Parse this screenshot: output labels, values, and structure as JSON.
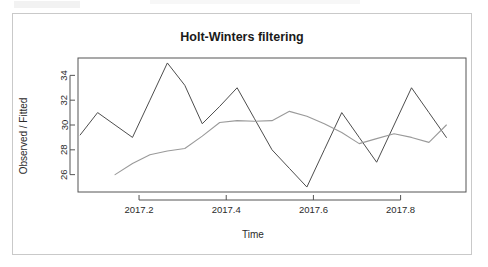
{
  "figure": {
    "title": "Holt-Winters filtering",
    "x_axis_label": "Time",
    "y_axis_label": "Observed / Fitted"
  },
  "chart_data": {
    "type": "line",
    "title": "Holt-Winters filtering",
    "xlabel": "Time",
    "ylabel": "Observed / Fitted",
    "grid": false,
    "legend": "none",
    "xlim": [
      2017.06,
      2017.95
    ],
    "ylim": [
      24.6,
      35.4
    ],
    "xticks": [
      2017.2,
      2017.4,
      2017.6,
      2017.8
    ],
    "xtick_labels": [
      "2017.2",
      "2017.4",
      "2017.6",
      "2017.8"
    ],
    "yticks": [
      26,
      28,
      30,
      32,
      34
    ],
    "ytick_labels": [
      "26",
      "28",
      "30",
      "32",
      "34"
    ],
    "series": [
      {
        "name": "Observed",
        "color": "#4d4d4d",
        "x": [
          2017.065,
          2017.105,
          2017.145,
          2017.185,
          2017.225,
          2017.265,
          2017.305,
          2017.345,
          2017.385,
          2017.425,
          2017.465,
          2017.505,
          2017.545,
          2017.585,
          2017.625,
          2017.665,
          2017.705,
          2017.745,
          2017.785,
          2017.825,
          2017.865,
          2017.905
        ],
        "values": [
          29.2,
          31.0,
          30.0,
          29.0,
          32.0,
          35.0,
          33.2,
          30.1,
          31.5,
          33.0,
          30.5,
          28.0,
          26.5,
          25.0,
          28.0,
          31.0,
          29.0,
          27.0,
          30.0,
          33.0,
          31.0,
          29.0
        ]
      },
      {
        "name": "Fitted",
        "color": "#9a9a9a",
        "x": [
          2017.145,
          2017.185,
          2017.225,
          2017.265,
          2017.305,
          2017.345,
          2017.385,
          2017.425,
          2017.465,
          2017.505,
          2017.545,
          2017.585,
          2017.625,
          2017.665,
          2017.705,
          2017.745,
          2017.785,
          2017.825,
          2017.865,
          2017.905
        ],
        "values": [
          26.0,
          26.9,
          27.6,
          27.9,
          28.1,
          29.1,
          30.2,
          30.35,
          30.3,
          30.35,
          31.1,
          30.7,
          30.1,
          29.4,
          28.5,
          28.9,
          29.3,
          29.0,
          28.6,
          30.0
        ]
      }
    ]
  }
}
